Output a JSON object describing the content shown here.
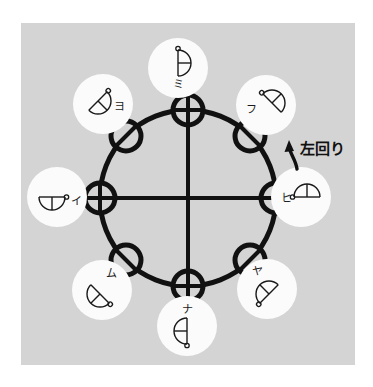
{
  "figure": {
    "type": "technical-diagram",
    "title_text": "左回り",
    "background_color": "#ffffff",
    "panel_color": "#d4d4d4",
    "ink_color": "#111111",
    "badge_color": "#fbfbfb",
    "rotation": {
      "label": "左回り",
      "meaning_reading": "hidarimawari",
      "arrow": "curved-arrow-up-left"
    },
    "center_circle": {
      "cx": 188,
      "cy": 198,
      "r": 88,
      "stroke_width": 5
    },
    "nodes": [
      {
        "id": "node-n",
        "label": "ミ",
        "angle_deg": 90,
        "position": "top",
        "node_cx": 188,
        "node_cy": 110,
        "node_type": "cross-vertical",
        "badge_cx": 178,
        "badge_cy": 68,
        "badge_r": 30,
        "glyph": "semicircle-right",
        "glyph_dot": "top",
        "label_side": "below"
      },
      {
        "id": "node-nw",
        "label": "ヨ",
        "angle_deg": 135,
        "position": "top-left",
        "node_cx": 126,
        "node_cy": 136,
        "node_type": "diagonal-slash",
        "badge_cx": 103,
        "badge_cy": 104,
        "badge_r": 30,
        "glyph": "semicircle-right-rot45",
        "glyph_dot": "top-left",
        "label_side": "right"
      },
      {
        "id": "node-ne",
        "label": "フ",
        "angle_deg": 45,
        "position": "top-right",
        "node_cx": 250,
        "node_cy": 136,
        "node_type": "diagonal-backslash",
        "badge_cx": 266,
        "badge_cy": 105,
        "badge_r": 30,
        "glyph": "semicircle-right-rot-45",
        "glyph_dot": "top-right",
        "label_side": "left"
      },
      {
        "id": "node-w",
        "label": "イ",
        "angle_deg": 180,
        "position": "left",
        "node_cx": 100,
        "node_cy": 198,
        "node_type": "cross-horizontal",
        "badge_cx": 57,
        "badge_cy": 197,
        "badge_r": 30,
        "glyph": "semicircle-left",
        "glyph_dot": "left",
        "label_side": "right"
      },
      {
        "id": "node-e",
        "label": "ヒ",
        "angle_deg": 0,
        "position": "right",
        "node_cx": 276,
        "node_cy": 198,
        "node_type": "cross-horizontal",
        "badge_cx": 301,
        "badge_cy": 197,
        "badge_r": 30,
        "glyph": "semicircle-right-dot-right",
        "glyph_dot": "right",
        "label_side": "left"
      },
      {
        "id": "node-sw",
        "label": "ム",
        "angle_deg": 225,
        "position": "bottom-left",
        "node_cx": 126,
        "node_cy": 260,
        "node_type": "diagonal-backslash",
        "badge_cx": 102,
        "badge_cy": 290,
        "badge_r": 30,
        "glyph": "semicircle-down-rot45",
        "glyph_dot": "bottom-left",
        "label_side": "above-right"
      },
      {
        "id": "node-se",
        "label": "ヤ",
        "angle_deg": 315,
        "position": "bottom-right",
        "node_cx": 250,
        "node_cy": 260,
        "node_type": "diagonal-slash",
        "badge_cx": 267,
        "badge_cy": 289,
        "badge_r": 30,
        "glyph": "semicircle-down-rot-45",
        "glyph_dot": "bottom-right",
        "label_side": "above-left"
      },
      {
        "id": "node-s",
        "label": "ナ",
        "angle_deg": 270,
        "position": "bottom",
        "node_cx": 188,
        "node_cy": 286,
        "node_type": "cross-vertical",
        "badge_cx": 187,
        "badge_cy": 326,
        "badge_r": 30,
        "glyph": "semicircle-down",
        "glyph_dot": "bottom",
        "label_side": "above"
      }
    ]
  }
}
